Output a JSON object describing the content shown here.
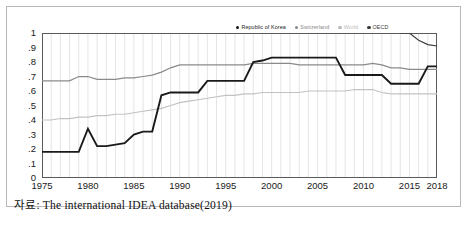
{
  "caption": "자료: The international IDEA database(2019)",
  "legend": [
    {
      "name": "Republic of Korea",
      "color": "#1a1a1a"
    },
    {
      "name": "Switzerland",
      "color": "#888888"
    },
    {
      "name": "World",
      "color": "#bbbbbb"
    },
    {
      "name": "OECD",
      "color": "#3a3a3a"
    }
  ],
  "axis": {
    "y_ticks": [
      "0",
      ".1",
      ".2",
      ".3",
      ".4",
      ".5",
      ".6",
      ".7",
      ".8",
      ".9",
      "1"
    ],
    "x_ticks": [
      "1975",
      "1980",
      "1985",
      "1990",
      "1995",
      "2000",
      "2005",
      "2010",
      "2015",
      "2018"
    ]
  },
  "chart_data": {
    "type": "line",
    "title": "",
    "xlabel": "",
    "ylabel": "",
    "xlim": [
      1975,
      2018
    ],
    "ylim": [
      0,
      1
    ],
    "grid": true,
    "legend_position": "top-right",
    "x": [
      1975,
      1976,
      1977,
      1978,
      1979,
      1980,
      1981,
      1982,
      1983,
      1984,
      1985,
      1986,
      1987,
      1988,
      1989,
      1990,
      1991,
      1992,
      1993,
      1994,
      1995,
      1996,
      1997,
      1998,
      1999,
      2000,
      2001,
      2002,
      2003,
      2004,
      2005,
      2006,
      2007,
      2008,
      2009,
      2010,
      2011,
      2012,
      2013,
      2014,
      2015,
      2016,
      2017,
      2018
    ],
    "series": [
      {
        "name": "Republic of Korea",
        "color": "#1a1a1a",
        "width": 1.9,
        "values": [
          0.18,
          0.18,
          0.18,
          0.18,
          0.18,
          0.34,
          0.22,
          0.22,
          0.23,
          0.24,
          0.3,
          0.32,
          0.32,
          0.57,
          0.59,
          0.59,
          0.59,
          0.59,
          0.67,
          0.67,
          0.67,
          0.67,
          0.67,
          0.8,
          0.81,
          0.83,
          0.83,
          0.83,
          0.83,
          0.83,
          0.83,
          0.83,
          0.83,
          0.71,
          0.71,
          0.71,
          0.71,
          0.71,
          0.65,
          0.65,
          0.65,
          0.65,
          0.77,
          0.77
        ]
      },
      {
        "name": "Switzerland",
        "color": "#8a8a8a",
        "width": 1.25,
        "values": [
          0.67,
          0.67,
          0.67,
          0.67,
          0.7,
          0.7,
          0.68,
          0.68,
          0.68,
          0.69,
          0.69,
          0.7,
          0.71,
          0.73,
          0.76,
          0.78,
          0.78,
          0.78,
          0.78,
          0.78,
          0.78,
          0.78,
          0.78,
          0.79,
          0.79,
          0.79,
          0.79,
          0.79,
          0.78,
          0.78,
          0.78,
          0.78,
          0.78,
          0.78,
          0.78,
          0.78,
          0.79,
          0.78,
          0.76,
          0.76,
          0.75,
          0.75,
          0.75,
          0.75
        ]
      },
      {
        "name": "World",
        "color": "#c2c2c2",
        "width": 1.15,
        "values": [
          0.4,
          0.4,
          0.41,
          0.41,
          0.42,
          0.42,
          0.43,
          0.43,
          0.44,
          0.44,
          0.45,
          0.46,
          0.47,
          0.48,
          0.5,
          0.52,
          0.53,
          0.54,
          0.55,
          0.56,
          0.57,
          0.57,
          0.58,
          0.58,
          0.59,
          0.59,
          0.59,
          0.59,
          0.59,
          0.6,
          0.6,
          0.6,
          0.6,
          0.6,
          0.61,
          0.61,
          0.61,
          0.59,
          0.58,
          0.58,
          0.58,
          0.58,
          0.58,
          0.58
        ]
      },
      {
        "name": "OECD",
        "color": "#3a3a3a",
        "width": 1.1,
        "values": [
          null,
          null,
          null,
          null,
          null,
          null,
          null,
          null,
          null,
          null,
          null,
          null,
          null,
          null,
          null,
          null,
          null,
          null,
          null,
          null,
          null,
          null,
          null,
          null,
          null,
          null,
          null,
          null,
          null,
          null,
          null,
          null,
          null,
          null,
          null,
          null,
          null,
          null,
          null,
          1.02,
          1.0,
          0.95,
          0.92,
          0.91
        ]
      }
    ]
  }
}
